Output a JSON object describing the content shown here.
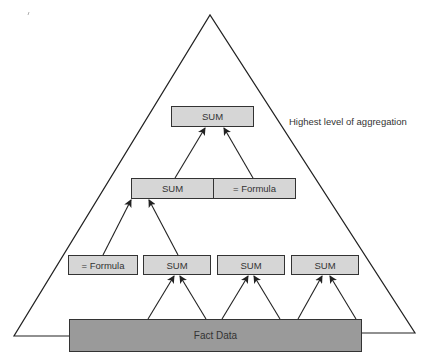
{
  "diagram": {
    "title_annotation": "Highest level of aggregation",
    "top": {
      "label": "SUM"
    },
    "middle": [
      {
        "label": "SUM"
      },
      {
        "label": "= Formula"
      }
    ],
    "bottom": [
      {
        "label": "= Formula"
      },
      {
        "label": "SUM"
      },
      {
        "label": "SUM"
      },
      {
        "label": "SUM"
      }
    ],
    "base": {
      "label": "Fact Data"
    },
    "colors": {
      "box_fill": "#d6d6d6",
      "base_fill": "#9a9a9a",
      "stroke": "#333333"
    }
  }
}
